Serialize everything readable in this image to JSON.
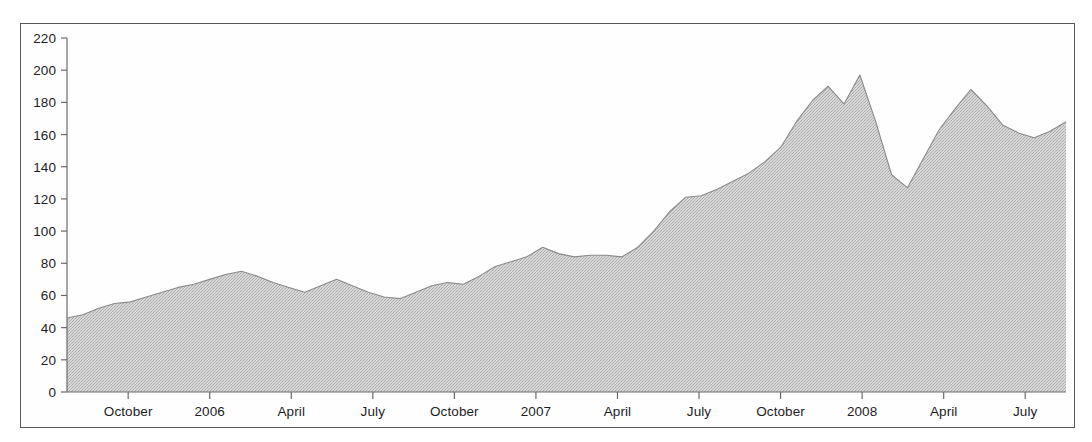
{
  "chart_data": {
    "type": "area",
    "title": "",
    "subtitle": "",
    "xlabel": "",
    "ylabel": "",
    "grid": false,
    "legend": "none",
    "fill_color": "#c9c9c9",
    "line_color": "#8a8a8c",
    "frame_color": "#58585a",
    "background_color": "#ffffff",
    "ylim": [
      0,
      220
    ],
    "y_ticks": [
      0,
      20,
      40,
      60,
      80,
      100,
      120,
      140,
      160,
      180,
      200,
      220
    ],
    "y_tick_labels": [
      "0",
      "20",
      "40",
      "60",
      "80",
      "100",
      "120",
      "140",
      "160",
      "180",
      "200",
      "220"
    ],
    "x_tick_labels": [
      "October",
      "2006",
      "April",
      "July",
      "October",
      "2007",
      "April",
      "July",
      "October",
      "2008",
      "April",
      "July"
    ],
    "x_tick_index": [
      3,
      7,
      11,
      15,
      19,
      23,
      27,
      31,
      35,
      39,
      43,
      47
    ],
    "x_index_range": [
      0,
      49
    ],
    "values": [
      46,
      48,
      52,
      55,
      56,
      59,
      62,
      65,
      67,
      70,
      73,
      75,
      72,
      68,
      65,
      62,
      66,
      70,
      66,
      62,
      59,
      58,
      62,
      66,
      68,
      67,
      72,
      78,
      81,
      84,
      90,
      86,
      84,
      85,
      85,
      84,
      90,
      100,
      112,
      121,
      122,
      126,
      131,
      136,
      143,
      152,
      168,
      181,
      190,
      179,
      197,
      168,
      135,
      127,
      145,
      163,
      176,
      188,
      178,
      166,
      161,
      158,
      162,
      168
    ],
    "series_name": "value",
    "notes_peaks": [
      {
        "label": "first-peak",
        "value": 75
      },
      {
        "label": "mid-peak",
        "value": 90
      },
      {
        "label": "high-peak",
        "value": 197
      },
      {
        "label": "trough",
        "value": 127
      },
      {
        "label": "late-peak",
        "value": 188
      },
      {
        "label": "end",
        "value": 168
      }
    ]
  }
}
